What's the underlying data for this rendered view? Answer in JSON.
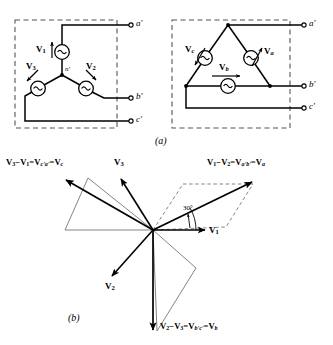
{
  "figure": {
    "caption_a": "(a)",
    "caption_b": "(b)"
  },
  "circuit_wye": {
    "name": "wye-connected-source",
    "source_symbol": "~",
    "neutral_label": "n'",
    "phase_labels": [
      {
        "name": "V1",
        "base": "V",
        "sub": "1"
      },
      {
        "name": "V2",
        "base": "V",
        "sub": "2"
      },
      {
        "name": "V3",
        "base": "V",
        "sub": "3"
      }
    ],
    "terminals": [
      {
        "name": "a-prime",
        "label": "a'"
      },
      {
        "name": "b-prime",
        "label": "b'"
      },
      {
        "name": "c-prime",
        "label": "c'"
      }
    ]
  },
  "circuit_delta": {
    "name": "delta-connected-source",
    "source_symbol": "~",
    "phase_labels": [
      {
        "name": "Va",
        "base": "V",
        "sub": "a"
      },
      {
        "name": "Vb",
        "base": "V",
        "sub": "b"
      },
      {
        "name": "Vc",
        "base": "V",
        "sub": "c"
      }
    ],
    "terminals": [
      {
        "name": "a-prime",
        "label": "a'"
      },
      {
        "name": "b-prime",
        "label": "b'"
      },
      {
        "name": "c-prime",
        "label": "c'"
      }
    ]
  },
  "phasor_diagram": {
    "name": "three-phase-phasor-diagram",
    "angle_marker": "30°",
    "phase_vectors": [
      {
        "name": "V1",
        "base": "V",
        "sub": "1",
        "angle_deg": 0
      },
      {
        "name": "V2",
        "base": "V",
        "sub": "2",
        "angle_deg": -120
      },
      {
        "name": "V3",
        "base": "V",
        "sub": "3",
        "angle_deg": 120
      }
    ],
    "line_vectors": [
      {
        "name": "Va",
        "equation_html": "<b>V</b><span class=\"sb\">1</span>−<b>V</b><span class=\"sb\">2</span>=<b>V</b><span class=\"sb\"><span class=\"it\">a'b'</span></span>=<b>V</b><span class=\"sb\"><span class=\"it\">a</span></span>",
        "equation_text": "V1−V2=Va'b'=Va",
        "angle_deg": 30
      },
      {
        "name": "Vb",
        "equation_html": "<b>V</b><span class=\"sb\">2</span>−<b>V</b><span class=\"sb\">3</span>=<b>V</b><span class=\"sb\"><span class=\"it\">b'c'</span></span>=<b>V</b><span class=\"sb\"><span class=\"it\">b</span></span>",
        "equation_text": "V2−V3=Vb'c'=Vb",
        "angle_deg": -90
      },
      {
        "name": "Vc",
        "equation_html": "<b>V</b><span class=\"sb\">3</span>−<b>V</b><span class=\"sb\">1</span>=<b>V</b><span class=\"sb\"><span class=\"it\">c'a'</span></span>=<b>V</b><span class=\"sb\"><span class=\"it\">c</span></span>",
        "equation_text": "V3−V1=Vc'a'=Vc",
        "angle_deg": 150
      }
    ]
  },
  "style": {
    "stroke": "#000000",
    "dashed_box": "#555555",
    "thin_line": "#444444"
  }
}
